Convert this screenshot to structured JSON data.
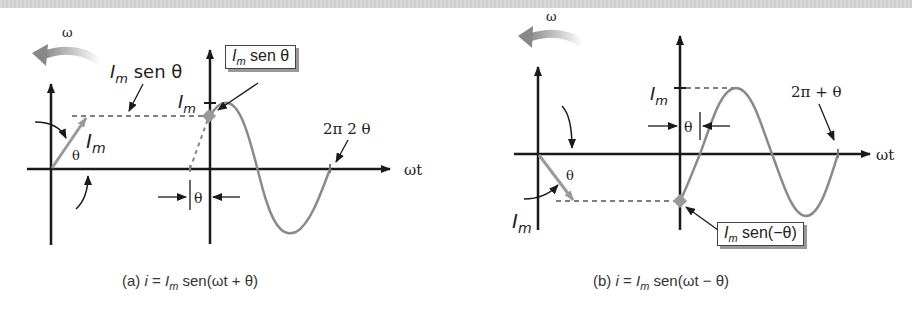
{
  "figure": {
    "panels": [
      {
        "id": "a",
        "caption_prefix": "(a)",
        "caption_var": "i",
        "caption_eq": "=",
        "caption_I": "I",
        "caption_sub": "m",
        "caption_rest": "sen(ωt + θ)",
        "omega_label": "ω",
        "phasor_label_I": "I",
        "phasor_label_sub": "m",
        "theta_label": "θ",
        "projection_label_I": "I",
        "projection_label_sub": "m",
        "projection_label_rest": " sen θ",
        "peak_label_I": "I",
        "peak_label_sub": "m",
        "box_label_I": "I",
        "box_label_sub": "m",
        "box_label_rest": " sen θ",
        "shift_label": "θ",
        "period_label": "2π 2 θ",
        "axis_label": "ωt"
      },
      {
        "id": "b",
        "caption_prefix": "(b)",
        "caption_var": "i",
        "caption_eq": "=",
        "caption_I": "I",
        "caption_sub": "m",
        "caption_rest": "sen(ωt − θ)",
        "omega_label": "ω",
        "phasor_label_I": "I",
        "phasor_label_sub": "m",
        "theta_label": "θ",
        "peak_label_I": "I",
        "peak_label_sub": "m",
        "box_label_I": "I",
        "box_label_sub": "m",
        "box_label_rest": " sen(−θ)",
        "shift_label": "θ",
        "period_label": "2π + θ",
        "axis_label": "ωt"
      }
    ],
    "colors": {
      "axis": "#1a1a1a",
      "wave": "#8a8a8a",
      "phasor": "#9a9a9a",
      "dashed": "#555555",
      "marker": "#999999"
    }
  }
}
